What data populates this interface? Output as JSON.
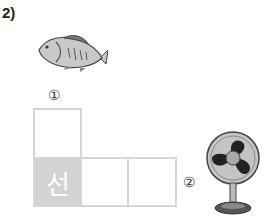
{
  "problem_label": "2)",
  "markers": {
    "one": "①",
    "two": "②"
  },
  "grid": {
    "filled_cell": "선",
    "cells": [
      "",
      "선",
      "",
      ""
    ]
  },
  "images": {
    "fish": "fish-illustration",
    "fan": "electric-fan-illustration"
  }
}
